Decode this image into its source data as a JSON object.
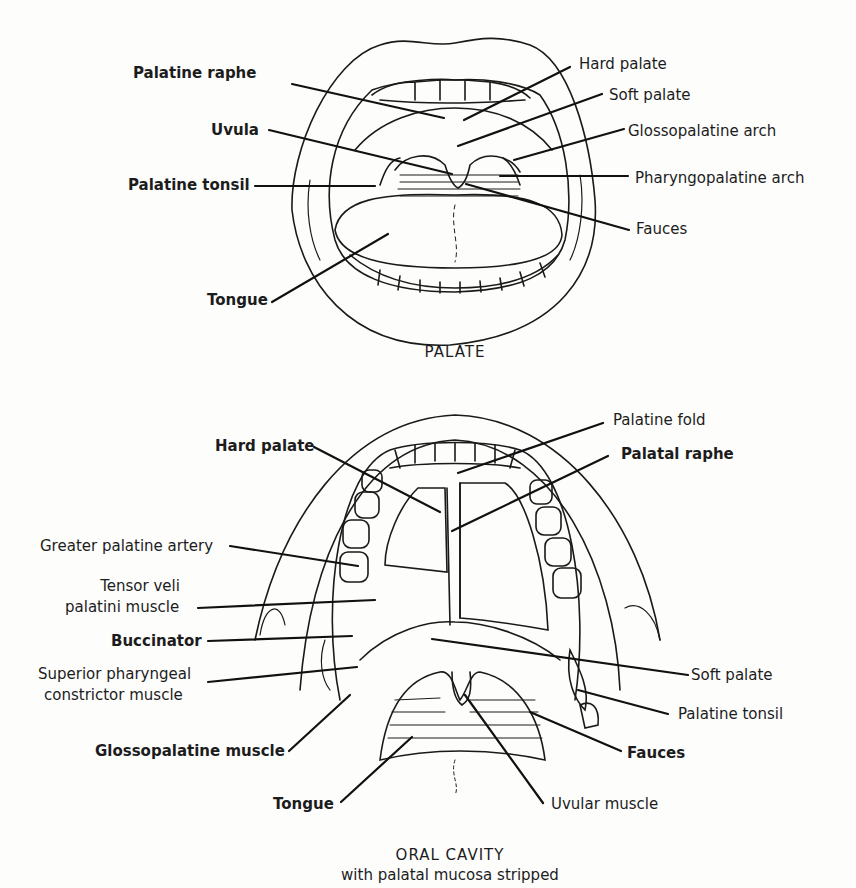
{
  "figures": [
    {
      "title": "PALATE",
      "labels": {
        "palatine_raphe": "Palatine raphe",
        "uvula": "Uvula",
        "palatine_tonsil": "Palatine tonsil",
        "tongue": "Tongue",
        "hard_palate": "Hard palate",
        "soft_palate": "Soft palate",
        "glossopalatine_arch": "Glossopalatine arch",
        "pharyngopalatine_arch": "Pharyngopalatine arch",
        "fauces": "Fauces"
      }
    },
    {
      "title": "ORAL CAVITY",
      "subtitle": "with palatal mucosa stripped",
      "labels": {
        "hard_palate": "Hard palate",
        "greater_palatine_artery": "Greater palatine artery",
        "tensor_veli_1": "Tensor veli",
        "tensor_veli_2": "palatini muscle",
        "buccinator": "Buccinator",
        "superior_pharyngeal_1": "Superior pharyngeal",
        "superior_pharyngeal_2": "constrictor muscle",
        "glossopalatine_muscle": "Glossopalatine muscle",
        "tongue": "Tongue",
        "palatine_fold": "Palatine fold",
        "palatal_raphe": "Palatal raphe",
        "soft_palate": "Soft palate",
        "palatine_tonsil": "Palatine tonsil",
        "fauces": "Fauces",
        "uvular_muscle": "Uvular muscle"
      }
    }
  ]
}
